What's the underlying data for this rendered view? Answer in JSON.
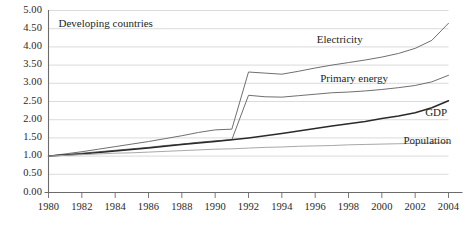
{
  "panel": {
    "title": "Developing countries"
  },
  "chart_data": {
    "type": "line",
    "title": "Developing countries",
    "subtitle": "",
    "xlabel": "",
    "ylabel": "",
    "xlim": [
      1980,
      2004
    ],
    "ylim": [
      0.0,
      5.0
    ],
    "grid": true,
    "legend_position": "inline-right",
    "annotations": [
      "Developing countries"
    ],
    "y_ticks": [
      "0.00",
      "0.50",
      "1.00",
      "1.50",
      "2.00",
      "2.50",
      "3.00",
      "3.50",
      "4.00",
      "4.50",
      "5.00"
    ],
    "y_tick_values": [
      0.0,
      0.5,
      1.0,
      1.5,
      2.0,
      2.5,
      3.0,
      3.5,
      4.0,
      4.5,
      5.0
    ],
    "x_ticks": [
      "1980",
      "1982",
      "1984",
      "1986",
      "1988",
      "1990",
      "1992",
      "1994",
      "1996",
      "1998",
      "2000",
      "2002",
      "2004"
    ],
    "x_tick_values": [
      1980,
      1982,
      1984,
      1986,
      1988,
      1990,
      1992,
      1994,
      1996,
      1998,
      2000,
      2002,
      2004
    ],
    "x": [
      1980,
      1981,
      1982,
      1983,
      1984,
      1985,
      1986,
      1987,
      1988,
      1989,
      1990,
      1991,
      1992,
      1993,
      1994,
      1995,
      1996,
      1997,
      1998,
      1999,
      2000,
      2001,
      2002,
      2003,
      2004
    ],
    "series": [
      {
        "name": "Electricity",
        "color": "#6f6f6f",
        "width": 1.0,
        "label_x": 1996.1,
        "label_y": 4.18,
        "values": [
          1.0,
          1.06,
          1.12,
          1.19,
          1.26,
          1.33,
          1.4,
          1.48,
          1.56,
          1.65,
          1.72,
          1.74,
          3.31,
          3.28,
          3.25,
          3.33,
          3.42,
          3.5,
          3.57,
          3.64,
          3.72,
          3.82,
          3.96,
          4.18,
          4.65
        ]
      },
      {
        "name": "Primary energy",
        "color": "#6f6f6f",
        "width": 1.0,
        "label_x": 1996.3,
        "label_y": 3.12,
        "values": [
          1.0,
          1.04,
          1.08,
          1.12,
          1.16,
          1.2,
          1.24,
          1.29,
          1.33,
          1.38,
          1.42,
          1.45,
          2.67,
          2.63,
          2.62,
          2.66,
          2.7,
          2.74,
          2.76,
          2.79,
          2.83,
          2.88,
          2.94,
          3.04,
          3.22
        ]
      },
      {
        "name": "GDP",
        "color": "#2a2a2a",
        "width": 1.5,
        "label_x": 2002.6,
        "label_y": 2.18,
        "values": [
          1.0,
          1.03,
          1.06,
          1.1,
          1.14,
          1.18,
          1.22,
          1.27,
          1.32,
          1.36,
          1.4,
          1.45,
          1.5,
          1.56,
          1.62,
          1.69,
          1.76,
          1.83,
          1.89,
          1.95,
          2.03,
          2.1,
          2.19,
          2.33,
          2.52
        ]
      },
      {
        "name": "Population",
        "color": "#a8a8a8",
        "width": 1.0,
        "label_x": 2001.3,
        "label_y": 1.42,
        "values": [
          1.0,
          1.02,
          1.04,
          1.06,
          1.08,
          1.09,
          1.11,
          1.13,
          1.15,
          1.17,
          1.19,
          1.2,
          1.22,
          1.24,
          1.25,
          1.27,
          1.28,
          1.29,
          1.31,
          1.32,
          1.33,
          1.34,
          1.35,
          1.36,
          1.37
        ]
      }
    ]
  },
  "axes": {
    "axis_color": "#6b6b6b",
    "grid_color": "#d2d2d2"
  }
}
